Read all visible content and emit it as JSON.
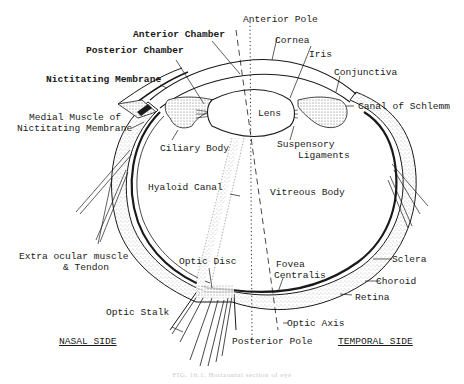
{
  "figure": {
    "caption": "FIG. 16.1. Horizontal section of eye",
    "sides": {
      "nasal": "NASAL SIDE",
      "temporal": "TEMPORAL SIDE"
    },
    "labels": {
      "anterior_pole": "Anterior Pole",
      "anterior_chamber": "Anterior Chamber",
      "posterior_chamber": "Posterior Chamber",
      "nictitating_membrane": "Nictitating Membrane",
      "medial_muscle_1": "Medial Muscle of",
      "medial_muscle_2": "Nictitating Membrane",
      "cornea": "Cornea",
      "iris": "Iris",
      "conjunctiva": "Conjunctiva",
      "canal_of_schlemm": "Canal of Schlemm",
      "lens": "Lens",
      "ciliary_body": "Ciliary Body",
      "suspensory_1": "Suspensory",
      "suspensory_2": "Ligaments",
      "hyaloid_canal": "Hyaloid Canal",
      "vitreous_body": "Vitreous Body",
      "extra_ocular_1": "Extra ocular muscle",
      "extra_ocular_2": "& Tendon",
      "optic_disc": "Optic Disc",
      "fovea_1": "Fovea",
      "fovea_2": "Centralis",
      "sclera": "Sclera",
      "choroid": "Choroid",
      "retina": "Retina",
      "optic_stalk": "Optic Stalk",
      "optic_axis": "Optic Axis",
      "posterior_pole": "Posterior Pole"
    },
    "colors": {
      "ink": "#1a1a1a",
      "background": "#ffffff",
      "stipple": "#9a9a9a",
      "caption": "#c8c8c8"
    }
  }
}
